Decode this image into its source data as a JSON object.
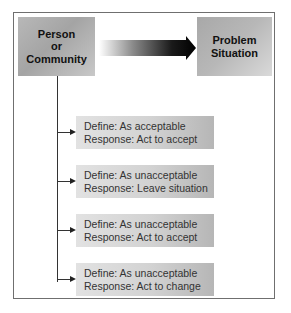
{
  "diagram": {
    "source_box": {
      "label": "Person\nor\nCommunity"
    },
    "target_box": {
      "label": "Problem\nSituation"
    },
    "connector": {
      "type": "gradient-arrow",
      "from": "source_box",
      "to": "target_box"
    },
    "options": [
      {
        "define": "Define: As acceptable",
        "response": "Response: Act to accept",
        "top": 116
      },
      {
        "define": "Define: As unacceptable",
        "response": "Response: Leave situation",
        "top": 165
      },
      {
        "define": "Define: As unacceptable",
        "response": "Response: Act to accept",
        "top": 214
      },
      {
        "define": "Define: As unacceptable",
        "response": "Response: Act to change",
        "top": 263
      }
    ]
  },
  "colors": {
    "frame_border": "#6f6f6f",
    "box_gray": "#b0b0b0",
    "arrow_dark": "#000000",
    "line": "#333333",
    "text": "#111111"
  }
}
